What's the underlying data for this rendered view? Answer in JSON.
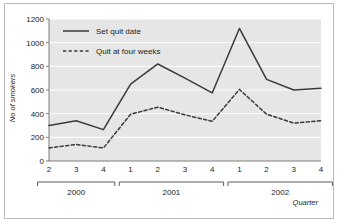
{
  "figure": {
    "background_color": "#ffffff",
    "border_color": "#b9b9b9",
    "plot_background_color": "#e6e6e6",
    "gridline_color": "#ffffff",
    "line_color": "#3a3a3a"
  },
  "chart_data": {
    "type": "line",
    "title": "",
    "xlabel": "Quarter",
    "ylabel": "No of smokers",
    "ylim": [
      0,
      1200
    ],
    "yticks": [
      0,
      200,
      400,
      600,
      800,
      1000,
      1200
    ],
    "ytick_labels": [
      "0",
      "200",
      "400",
      "600",
      "800",
      "1000",
      "1200"
    ],
    "grid": "horizontal",
    "legend_position": "upper-left-inside",
    "x": [
      "2",
      "3",
      "4",
      "1",
      "2",
      "3",
      "4",
      "1",
      "2",
      "3",
      "4"
    ],
    "categories": [
      "2",
      "3",
      "4",
      "1",
      "2",
      "3",
      "4",
      "1",
      "2",
      "3",
      "4"
    ],
    "x_groups": [
      {
        "label": "2000",
        "quarters": [
          "2",
          "3",
          "4"
        ]
      },
      {
        "label": "2001",
        "quarters": [
          "1",
          "2",
          "3",
          "4"
        ]
      },
      {
        "label": "2002",
        "quarters": [
          "1",
          "2",
          "3",
          "4"
        ]
      }
    ],
    "series": [
      {
        "name": "Set quit date",
        "style": "solid",
        "color": "#3a3a3a",
        "values": [
          300,
          340,
          265,
          650,
          820,
          700,
          575,
          1120,
          690,
          600,
          615
        ]
      },
      {
        "name": "Quit at four weeks",
        "style": "dashed",
        "color": "#3a3a3a",
        "values": [
          110,
          140,
          110,
          395,
          455,
          390,
          335,
          605,
          395,
          320,
          340
        ]
      }
    ]
  },
  "legend": {
    "items": [
      {
        "label": "Set quit date",
        "style": "solid"
      },
      {
        "label": "Quit at four weeks",
        "style": "dashed"
      }
    ]
  }
}
